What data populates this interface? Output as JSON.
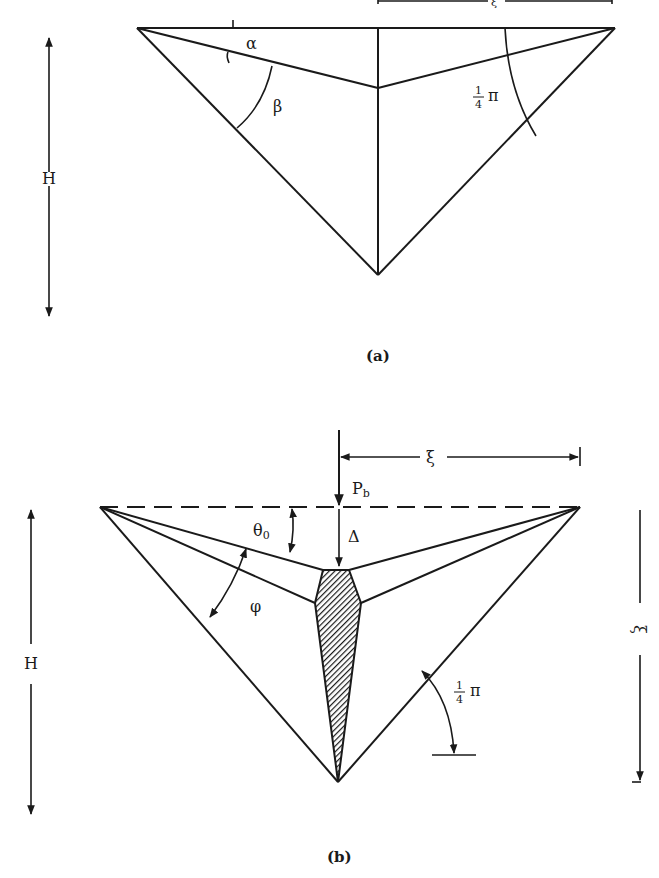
{
  "figure": {
    "panel_a": {
      "caption": "(a)",
      "labels": {
        "alpha": "α",
        "beta": "β",
        "quarter_pi_num": "1",
        "quarter_pi_den": "4",
        "pi": "π",
        "height": "H",
        "xi_top": "ξ"
      }
    },
    "panel_b": {
      "caption": "(b)",
      "labels": {
        "xi_top": "ξ",
        "load": "P",
        "load_sub": "b",
        "theta": "θ",
        "theta_sub": "0",
        "delta": "Δ",
        "phi": "φ",
        "quarter_pi_num": "1",
        "quarter_pi_den": "4",
        "pi": "π",
        "height": "H",
        "xi_right": "ξ"
      }
    }
  },
  "colors": {
    "ink": "#1a1a1a",
    "background": "#ffffff"
  }
}
